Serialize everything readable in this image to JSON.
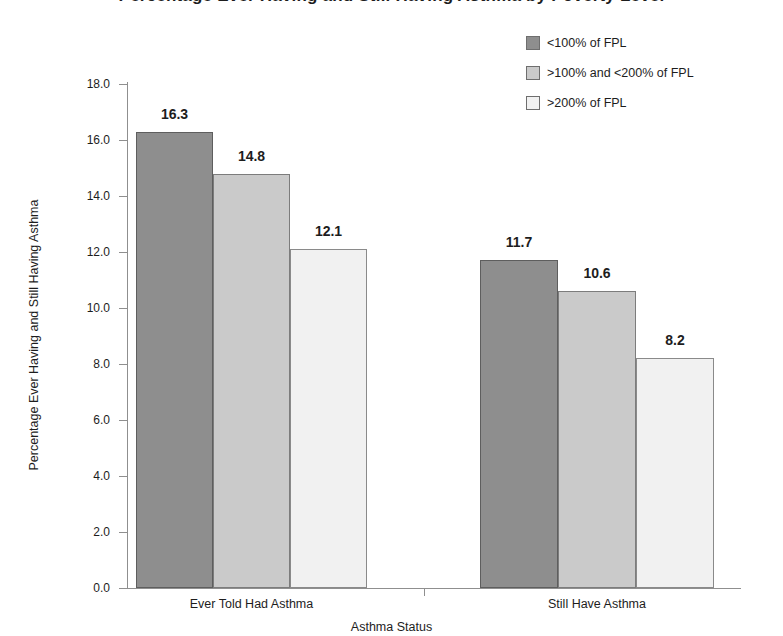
{
  "chart_data": {
    "type": "bar",
    "title": "Percentage Ever Having and Still Having Asthma by Poverty Level",
    "xlabel": "Asthma Status",
    "ylabel": "Percentage Ever Having and Still Having Asthma",
    "categories": [
      "Ever Told Had Asthma",
      "Still Have Asthma"
    ],
    "series": [
      {
        "name": "<100% of FPL",
        "color": "#8e8e8e",
        "values": [
          16.3,
          11.7
        ]
      },
      {
        "name": ">100% and <200% of FPL",
        "color": "#cacaca",
        "values": [
          14.8,
          10.6
        ]
      },
      {
        "name": ">200% of FPL",
        "color": "#f1f1f1",
        "values": [
          12.1,
          8.2
        ]
      }
    ],
    "ylim": [
      0.0,
      18.0
    ],
    "ytick_step": 2.0,
    "ytick_labels": [
      "0.0",
      "2.0",
      "4.0",
      "6.0",
      "8.0",
      "10.0",
      "12.0",
      "14.0",
      "16.0",
      "18.0"
    ],
    "grid": false,
    "legend_position": "top-right"
  },
  "legend": {
    "items": [
      {
        "label": "<100% of FPL",
        "swatch": "dark-gray-swatch"
      },
      {
        "label": ">100% and <200% of FPL",
        "swatch": "mid-gray-swatch"
      },
      {
        "label": ">200% of FPL",
        "swatch": "light-gray-swatch"
      }
    ]
  },
  "axes": {
    "y_title": "Percentage Ever Having and Still Having Asthma",
    "x_title": "Asthma Status",
    "y_labels": [
      "18.0",
      "16.0",
      "14.0",
      "12.0",
      "10.0",
      "8.0",
      "6.0",
      "4.0",
      "2.0",
      "0.0"
    ],
    "x_labels": [
      "Ever Told Had Asthma",
      "Still Have Asthma"
    ]
  },
  "bar_values": {
    "g0s0": "16.3",
    "g0s1": "14.8",
    "g0s2": "12.1",
    "g1s0": "11.7",
    "g1s1": "10.6",
    "g1s2": "8.2"
  },
  "title": {
    "text": "Percentage Ever Having and Still Having Asthma by Poverty Level"
  }
}
